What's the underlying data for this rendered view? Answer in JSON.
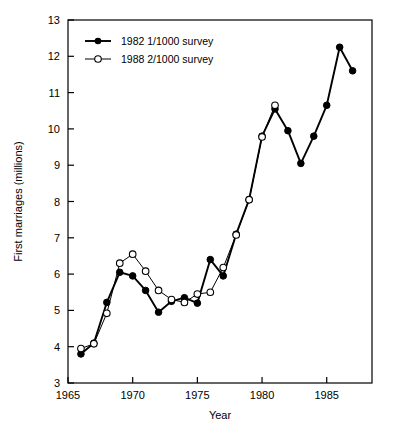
{
  "chart_data": {
    "type": "line",
    "title": "",
    "xlabel": "Year",
    "ylabel": "First marriages (millions)",
    "xlim": [
      1965,
      1988.5
    ],
    "ylim": [
      3,
      13
    ],
    "xticks": [
      1965,
      1970,
      1975,
      1980,
      1985
    ],
    "yticks": [
      3,
      4,
      5,
      6,
      7,
      8,
      9,
      10,
      11,
      12,
      13
    ],
    "xtick_labels": [
      "1965",
      "1970",
      "1975",
      "1980",
      "1985"
    ],
    "ytick_labels": [
      "3",
      "4",
      "5",
      "6",
      "7",
      "8",
      "9",
      "10",
      "11",
      "12",
      "13"
    ],
    "grid": false,
    "legend_position": "top-left",
    "series": [
      {
        "name": "1982 1/1000 survey",
        "marker": "filled-circle",
        "color": "#000000",
        "x": [
          1966,
          1967,
          1968,
          1969,
          1970,
          1971,
          1972,
          1973,
          1974,
          1975,
          1976,
          1977,
          1978,
          1979,
          1980,
          1981,
          1982,
          1983,
          1984,
          1985,
          1986,
          1987
        ],
        "values": [
          3.8,
          4.1,
          5.22,
          6.05,
          5.95,
          5.55,
          4.95,
          5.25,
          5.35,
          5.2,
          6.4,
          5.95,
          7.1,
          8.05,
          9.8,
          10.55,
          9.95,
          9.05,
          9.8,
          10.65,
          12.25,
          11.6
        ]
      },
      {
        "name": "1988 2/1000 survey",
        "marker": "open-circle",
        "color": "#000000",
        "x": [
          1966,
          1967,
          1968,
          1969,
          1970,
          1971,
          1972,
          1973,
          1974,
          1975,
          1976,
          1977,
          1978,
          1979,
          1980,
          1981
        ],
        "values": [
          3.95,
          4.08,
          4.92,
          6.3,
          6.55,
          6.08,
          5.55,
          5.3,
          5.22,
          5.45,
          5.5,
          6.18,
          7.08,
          8.05,
          9.78,
          10.65
        ]
      }
    ]
  },
  "legend": {
    "items": [
      {
        "label": "1982 1/1000 survey",
        "marker": "filled-circle"
      },
      {
        "label": "1988 2/1000 survey",
        "marker": "open-circle"
      }
    ]
  }
}
